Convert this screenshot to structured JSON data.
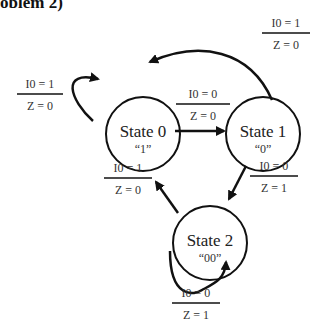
{
  "title": "oblem 2)",
  "states": [
    {
      "id": "s0",
      "name": "State 0",
      "output": "“1”",
      "cx": 143,
      "cy": 134
    },
    {
      "id": "s1",
      "name": "State 1",
      "output": "“0”",
      "cx": 263,
      "cy": 134
    },
    {
      "id": "s2",
      "name": "State 2",
      "output": "“00”",
      "cx": 210,
      "cy": 243
    }
  ],
  "transitions": [
    {
      "id": "s1-to-s0",
      "from": "State 1",
      "to": "State 0",
      "input": "I0 = 1",
      "output": "Z = 0"
    },
    {
      "id": "s0-self",
      "from": "State 0",
      "to": "State 0",
      "input": "I0 = 1",
      "output": "Z = 0"
    },
    {
      "id": "s0-to-s1",
      "from": "State 0",
      "to": "State 1",
      "input": "I0 = 0",
      "output": "Z = 0"
    },
    {
      "id": "s2-to-s0",
      "from": "State 2",
      "to": "State 0",
      "input": "I0 = 1",
      "output": "Z = 0"
    },
    {
      "id": "s1-to-s2",
      "from": "State 1",
      "to": "State 2",
      "input": "I0 = 0",
      "output": "Z = 1"
    },
    {
      "id": "s2-self",
      "from": "State 2",
      "to": "State 2",
      "input": "I0 = 0",
      "output": "Z = 1"
    }
  ],
  "colors": {
    "stroke": "#111111",
    "text": "#333333",
    "background": "#ffffff"
  }
}
